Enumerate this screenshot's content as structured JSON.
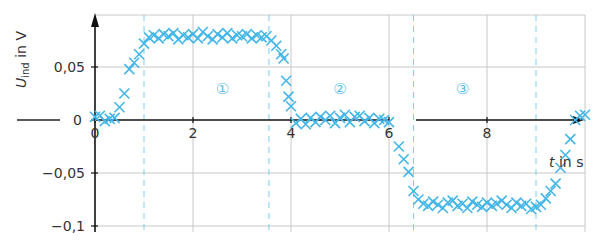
{
  "chart_data": {
    "type": "scatter",
    "title": "",
    "xlabel": "t in s",
    "ylabel": "U_ind in V",
    "ylabel_main": "U",
    "ylabel_sub": "ind",
    "ylabel_unit": " in V",
    "xlim": [
      0,
      10
    ],
    "ylim": [
      -0.1,
      0.09
    ],
    "grid": true,
    "legend": "none",
    "x_ticks": [
      0,
      2,
      4,
      6,
      8
    ],
    "x_tick_labels": [
      "0",
      "2",
      "4",
      "6",
      "8"
    ],
    "y_ticks": [
      -0.1,
      -0.05,
      0,
      0.05
    ],
    "y_tick_labels": [
      "−0,1",
      "−0,05",
      "0",
      "0,05"
    ],
    "x_gridlines": [
      2,
      4,
      6,
      8,
      10
    ],
    "y_gridlines": [
      -0.1,
      -0.05,
      0.05,
      0.1
    ],
    "dashed_boundaries": [
      1.0,
      3.55,
      6.5,
      9.0
    ],
    "regions": [
      {
        "label": "①",
        "x": 2.6,
        "y": 0.03
      },
      {
        "label": "②",
        "x": 5.0,
        "y": 0.03
      },
      {
        "label": "③",
        "x": 7.5,
        "y": 0.03
      }
    ],
    "zero_marker_label": "0",
    "series": [
      {
        "name": "U_ind measurements",
        "marker": "x",
        "color": "#45b6e8",
        "x": [
          0.0,
          0.1,
          0.2,
          0.3,
          0.4,
          0.5,
          0.6,
          0.7,
          0.8,
          0.9,
          1.0,
          1.1,
          1.2,
          1.3,
          1.4,
          1.5,
          1.6,
          1.7,
          1.8,
          1.9,
          2.0,
          2.1,
          2.2,
          2.3,
          2.4,
          2.5,
          2.6,
          2.7,
          2.8,
          2.9,
          3.0,
          3.1,
          3.2,
          3.3,
          3.4,
          3.5,
          3.6,
          3.7,
          3.8,
          3.85,
          3.9,
          3.95,
          4.0,
          4.1,
          4.2,
          4.3,
          4.4,
          4.5,
          4.6,
          4.7,
          4.8,
          4.9,
          5.0,
          5.1,
          5.2,
          5.3,
          5.4,
          5.5,
          5.6,
          5.7,
          5.8,
          5.9,
          6.0,
          6.2,
          6.3,
          6.4,
          6.5,
          6.6,
          6.7,
          6.8,
          6.9,
          7.0,
          7.1,
          7.2,
          7.3,
          7.4,
          7.5,
          7.6,
          7.7,
          7.8,
          7.9,
          8.0,
          8.1,
          8.2,
          8.3,
          8.4,
          8.5,
          8.6,
          8.7,
          8.8,
          8.9,
          9.0,
          9.1,
          9.2,
          9.3,
          9.4,
          9.5,
          9.6,
          9.7,
          9.8,
          9.9,
          10.0
        ],
        "y": [
          0.003,
          0.004,
          -0.001,
          0.001,
          0.002,
          0.012,
          0.025,
          0.048,
          0.054,
          0.062,
          0.072,
          0.078,
          0.08,
          0.077,
          0.081,
          0.079,
          0.082,
          0.076,
          0.08,
          0.078,
          0.081,
          0.077,
          0.083,
          0.079,
          0.076,
          0.081,
          0.078,
          0.082,
          0.077,
          0.08,
          0.079,
          0.081,
          0.077,
          0.08,
          0.078,
          0.079,
          0.075,
          0.07,
          0.062,
          0.058,
          0.037,
          0.022,
          0.013,
          -0.003,
          0.001,
          -0.004,
          0.002,
          -0.002,
          0.003,
          0.0,
          0.004,
          -0.003,
          0.002,
          0.005,
          -0.002,
          0.003,
          0.004,
          -0.001,
          0.002,
          -0.003,
          0.001,
          0.0,
          -0.002,
          -0.025,
          -0.037,
          -0.049,
          -0.067,
          -0.075,
          -0.079,
          -0.081,
          -0.077,
          -0.08,
          -0.083,
          -0.078,
          -0.076,
          -0.081,
          -0.079,
          -0.083,
          -0.077,
          -0.08,
          -0.082,
          -0.078,
          -0.081,
          -0.079,
          -0.076,
          -0.08,
          -0.083,
          -0.078,
          -0.081,
          -0.079,
          -0.084,
          -0.082,
          -0.08,
          -0.074,
          -0.067,
          -0.06,
          -0.045,
          -0.033,
          -0.018,
          0.0,
          0.004,
          0.005
        ]
      }
    ]
  }
}
